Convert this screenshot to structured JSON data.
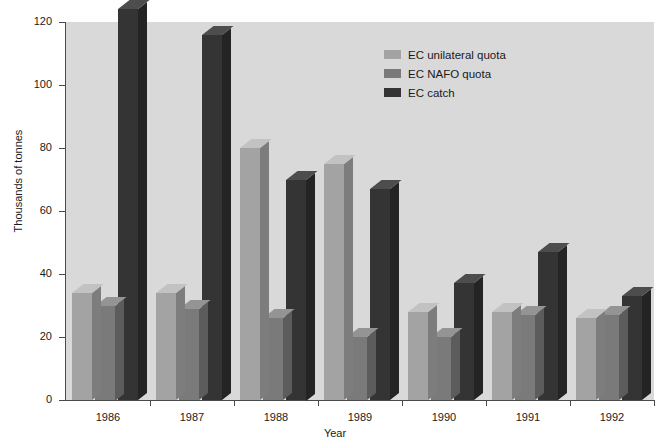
{
  "chart_data": {
    "type": "bar",
    "title": "",
    "subtitle": "",
    "xlabel": "Year",
    "ylabel": "Thousands of tonnes",
    "categories": [
      "1986",
      "1987",
      "1988",
      "1989",
      "1990",
      "1991",
      "1992"
    ],
    "series": [
      {
        "name": "EC unilateral quota",
        "color": "#a3a3a3",
        "values": [
          34,
          34,
          80,
          75,
          28,
          28,
          26
        ]
      },
      {
        "name": "EC NAFO quota",
        "color": "#7a7a7a",
        "values": [
          30,
          29,
          26,
          20,
          20,
          27,
          27
        ]
      },
      {
        "name": "EC catch",
        "color": "#343434",
        "values": [
          124,
          116,
          70,
          67,
          37,
          47,
          33
        ]
      }
    ],
    "ylim": [
      0,
      120
    ],
    "yticks": [
      0,
      20,
      40,
      60,
      80,
      100,
      120
    ],
    "ytick_labels": [
      "0",
      "20",
      "40",
      "60",
      "80",
      "100",
      "120"
    ],
    "grid": false,
    "legend_position": "top-right",
    "plot_background": "#d9d9d9"
  },
  "legend": {
    "entries": [
      {
        "label": "EC unilateral quota"
      },
      {
        "label": "EC NAFO quota"
      },
      {
        "label": "EC catch"
      }
    ]
  }
}
